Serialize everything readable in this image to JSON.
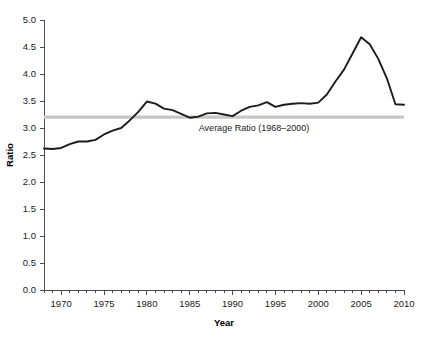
{
  "chart_data": {
    "type": "line",
    "title": "",
    "xlabel": "Year",
    "ylabel": "Ratio",
    "xlim": [
      1968,
      2010
    ],
    "ylim": [
      0.0,
      5.0
    ],
    "grid": false,
    "legend_position": "none",
    "x_ticks_major": [
      1970,
      1975,
      1980,
      1985,
      1990,
      1995,
      2000,
      2005,
      2010
    ],
    "x_tick_labels": [
      "1970",
      "1975",
      "1980",
      "1985",
      "1990",
      "1995",
      "2000",
      "2005",
      "2010"
    ],
    "x_tick_minor_step": 1,
    "y_ticks": [
      0.0,
      0.5,
      1.0,
      1.5,
      2.0,
      2.5,
      3.0,
      3.5,
      4.0,
      4.5,
      5.0
    ],
    "y_tick_labels": [
      "0.0",
      "0.5",
      "1.0",
      "1.5",
      "2.0",
      "2.5",
      "3.0",
      "3.5",
      "4.0",
      "4.5",
      "5.0"
    ],
    "series": [
      {
        "name": "Ratio",
        "color": "#1c1c1c",
        "x": [
          1968,
          1969,
          1970,
          1971,
          1972,
          1973,
          1974,
          1975,
          1976,
          1977,
          1978,
          1979,
          1980,
          1981,
          1982,
          1983,
          1984,
          1985,
          1986,
          1987,
          1988,
          1989,
          1990,
          1991,
          1992,
          1993,
          1994,
          1995,
          1996,
          1997,
          1998,
          1999,
          2000,
          2001,
          2002,
          2003,
          2004,
          2005,
          2006,
          2007,
          2008,
          2009,
          2010
        ],
        "values": [
          2.62,
          2.61,
          2.63,
          2.7,
          2.75,
          2.75,
          2.78,
          2.88,
          2.95,
          3.0,
          3.14,
          3.3,
          3.49,
          3.45,
          3.36,
          3.33,
          3.26,
          3.19,
          3.21,
          3.27,
          3.28,
          3.25,
          3.22,
          3.32,
          3.39,
          3.42,
          3.48,
          3.39,
          3.43,
          3.45,
          3.46,
          3.45,
          3.47,
          3.62,
          3.86,
          4.08,
          4.38,
          4.68,
          4.55,
          4.28,
          3.92,
          3.44,
          3.43
        ]
      }
    ],
    "reference_lines": [
      {
        "name": "average-ratio",
        "label": "Average Ratio (1968–2000)",
        "value": 3.2,
        "color": "#c6c6c6",
        "x_start": 1968,
        "x_end": 2010,
        "label_x": 1992.5,
        "label_y": 2.95
      }
    ]
  },
  "axis": {
    "x_title": "Year",
    "y_title": "Ratio"
  }
}
